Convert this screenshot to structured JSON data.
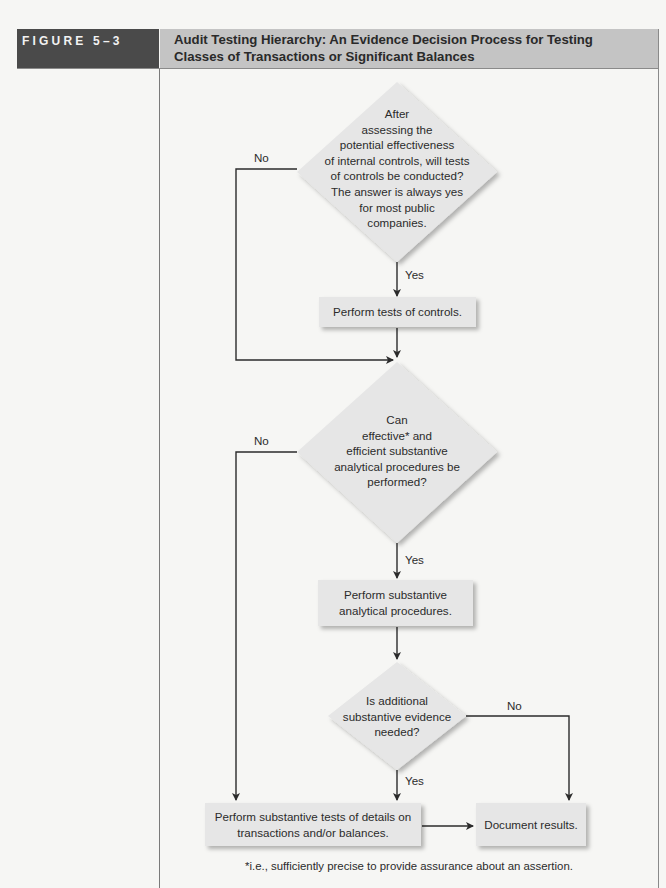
{
  "figure": {
    "label": "FIGURE 5–3",
    "title": "Audit Testing Hierarchy: An Evidence Decision Process for Testing Classes of Transactions or Significant Balances",
    "colors": {
      "label_bg": "#4a4a4a",
      "title_bg": "#c4c4c4",
      "shape_fill": "#e6e6e6",
      "line": "#2b2b2b"
    }
  },
  "flowchart": {
    "decision1": {
      "lines": [
        "After",
        "assessing the",
        "potential effectiveness",
        "of internal controls, will tests",
        "of controls be conducted?",
        "The answer is always yes",
        "for most public",
        "companies."
      ],
      "no_label": "No",
      "yes_label": "Yes"
    },
    "process1": {
      "text": "Perform tests of controls."
    },
    "decision2": {
      "lines": [
        "Can",
        "effective* and",
        "efficient substantive",
        "analytical procedures be",
        "performed?"
      ],
      "no_label": "No",
      "yes_label": "Yes"
    },
    "process2": {
      "lines": [
        "Perform substantive",
        "analytical procedures."
      ]
    },
    "decision3": {
      "lines": [
        "Is additional",
        "substantive evidence",
        "needed?"
      ],
      "no_label": "No",
      "yes_label": "Yes"
    },
    "process3": {
      "lines": [
        "Perform substantive tests of details on",
        "transactions and/or balances."
      ]
    },
    "process4": {
      "text": "Document results."
    }
  },
  "footnote": "*i.e., sufficiently precise to provide assurance about an assertion."
}
